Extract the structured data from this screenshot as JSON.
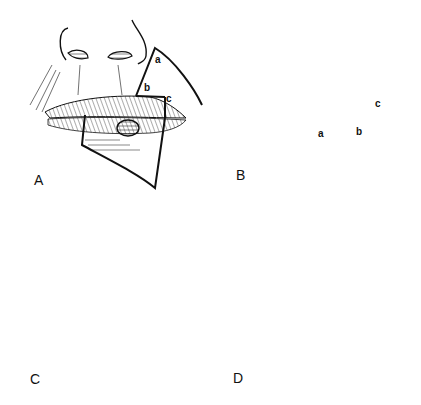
{
  "figure": {
    "colors": {
      "ink": "#111111",
      "background": "#ffffff"
    },
    "panels": [
      {
        "id": "A",
        "label": "A",
        "description": "Lower lip lesion with triangular excision outlined; upper-lip flap marked a-b-c",
        "points": [
          "a",
          "b",
          "c"
        ]
      },
      {
        "id": "B",
        "label": "B",
        "description": "Flap rotated from upper lip into lower lip defect; sutured donor site",
        "points": [
          "a",
          "b",
          "c"
        ]
      },
      {
        "id": "C",
        "label": "C",
        "description": "Flap inset, dotted suture lines with pedicle at commissure",
        "points": []
      },
      {
        "id": "D",
        "label": "D",
        "description": "Pedicle divided, commissure reconstructed and sutured",
        "points": []
      }
    ]
  }
}
